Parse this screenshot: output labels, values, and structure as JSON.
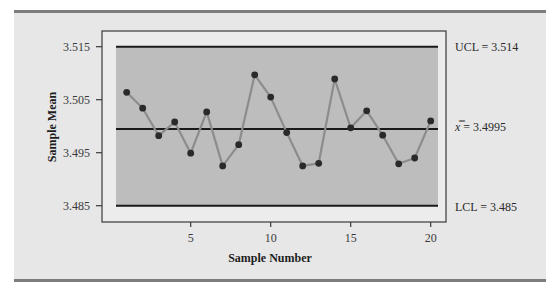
{
  "chart_data": {
    "type": "line",
    "title": "",
    "subtype": "x-bar control chart",
    "xlabel": "Sample Number",
    "ylabel": "Sample Mean",
    "x": [
      1,
      2,
      3,
      4,
      5,
      6,
      7,
      8,
      9,
      10,
      11,
      12,
      13,
      14,
      15,
      16,
      17,
      18,
      19,
      20
    ],
    "series": [
      {
        "name": "Sample Mean",
        "values": [
          3.5064,
          3.5034,
          3.4982,
          3.5008,
          3.4949,
          3.5027,
          3.4925,
          3.4965,
          3.5097,
          3.5055,
          3.4988,
          3.4925,
          3.493,
          3.5089,
          3.4997,
          3.5029,
          3.4983,
          3.4929,
          3.494,
          3.501
        ]
      }
    ],
    "control_limits": {
      "ucl": {
        "value": 3.514,
        "label": "UCL = 3.514"
      },
      "center": {
        "value": 3.4995,
        "label_symbol": "x̿",
        "label_rest": " = 3.4995"
      },
      "lcl": {
        "value": 3.485,
        "label": "LCL = 3.485"
      }
    },
    "xticks": [
      5,
      10,
      15,
      20
    ],
    "xtick_labels": [
      "5",
      "10",
      "15",
      "20"
    ],
    "yticks": [
      3.485,
      3.495,
      3.505,
      3.515
    ],
    "ytick_labels": [
      "3.485",
      "3.495",
      "3.505",
      "3.515"
    ],
    "xlim": [
      -0.6,
      21.1
    ],
    "ylim": [
      3.4815,
      3.5182
    ],
    "grid": false,
    "legend": "none"
  },
  "colors": {
    "panel_background": "#e7e7e7",
    "plot_shading": "#bdbdbd",
    "frame": "#3a3a3a",
    "limit_lines": "#1a1a1a",
    "series_line": "#8c8c8c",
    "markers": "#2a2a2a"
  }
}
